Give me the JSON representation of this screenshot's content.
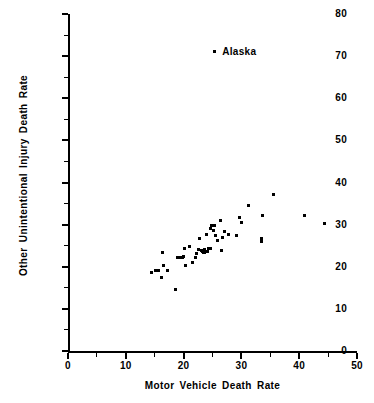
{
  "chart_data": {
    "type": "scatter",
    "title": "",
    "xlabel": "Motor Vehicle Death Rate",
    "ylabel": "Other Unintentional Injury Death Rate",
    "xlim": [
      0,
      50
    ],
    "ylim": [
      0,
      80
    ],
    "xticks": [
      0,
      10,
      20,
      30,
      40,
      50
    ],
    "yticks": [
      0,
      10,
      20,
      30,
      40,
      50,
      60,
      70,
      80
    ],
    "xtick_minor": [
      5,
      15,
      25,
      35,
      45
    ],
    "ytick_minor": [
      5,
      15,
      25,
      35,
      45,
      55,
      65,
      75
    ],
    "grid": false,
    "legend": null,
    "marker": "square-dot",
    "marker_color": "#000000",
    "annotations": [
      {
        "text": "Alaska",
        "x": 25.3,
        "y": 71.0,
        "label_dx": 8,
        "label_dy": 0
      }
    ],
    "points": [
      {
        "x": 25.3,
        "y": 71.0
      },
      {
        "x": 14.4,
        "y": 18.6
      },
      {
        "x": 15.1,
        "y": 19.1
      },
      {
        "x": 15.6,
        "y": 19.1
      },
      {
        "x": 16.1,
        "y": 17.5
      },
      {
        "x": 16.3,
        "y": 23.4
      },
      {
        "x": 16.6,
        "y": 20.2
      },
      {
        "x": 17.2,
        "y": 19.2
      },
      {
        "x": 18.6,
        "y": 14.6
      },
      {
        "x": 19.0,
        "y": 22.2
      },
      {
        "x": 19.4,
        "y": 22.3
      },
      {
        "x": 19.8,
        "y": 22.3
      },
      {
        "x": 20.0,
        "y": 22.4
      },
      {
        "x": 20.1,
        "y": 24.3
      },
      {
        "x": 20.3,
        "y": 20.3
      },
      {
        "x": 21.0,
        "y": 24.7
      },
      {
        "x": 21.6,
        "y": 21.0
      },
      {
        "x": 22.0,
        "y": 22.1
      },
      {
        "x": 22.3,
        "y": 23.2
      },
      {
        "x": 22.6,
        "y": 24.2
      },
      {
        "x": 22.8,
        "y": 26.6
      },
      {
        "x": 23.1,
        "y": 23.9
      },
      {
        "x": 23.3,
        "y": 23.6
      },
      {
        "x": 23.4,
        "y": 23.5
      },
      {
        "x": 23.6,
        "y": 24.1
      },
      {
        "x": 23.7,
        "y": 23.3
      },
      {
        "x": 23.9,
        "y": 27.7
      },
      {
        "x": 24.1,
        "y": 23.6
      },
      {
        "x": 24.3,
        "y": 24.3
      },
      {
        "x": 24.6,
        "y": 29.0
      },
      {
        "x": 24.7,
        "y": 24.4
      },
      {
        "x": 24.9,
        "y": 29.9
      },
      {
        "x": 25.1,
        "y": 28.6
      },
      {
        "x": 25.4,
        "y": 29.9
      },
      {
        "x": 25.6,
        "y": 27.4
      },
      {
        "x": 25.9,
        "y": 26.3
      },
      {
        "x": 26.3,
        "y": 31.0
      },
      {
        "x": 26.6,
        "y": 23.8
      },
      {
        "x": 26.7,
        "y": 26.9
      },
      {
        "x": 27.0,
        "y": 28.3
      },
      {
        "x": 27.8,
        "y": 27.6
      },
      {
        "x": 29.2,
        "y": 27.3
      },
      {
        "x": 29.6,
        "y": 31.8
      },
      {
        "x": 30.0,
        "y": 30.5
      },
      {
        "x": 31.2,
        "y": 34.6
      },
      {
        "x": 33.4,
        "y": 26.1
      },
      {
        "x": 33.4,
        "y": 26.8
      },
      {
        "x": 33.6,
        "y": 32.2
      },
      {
        "x": 35.6,
        "y": 37.1
      },
      {
        "x": 41.0,
        "y": 32.1
      },
      {
        "x": 44.3,
        "y": 30.2
      }
    ]
  }
}
